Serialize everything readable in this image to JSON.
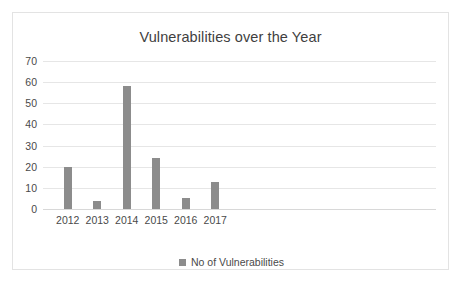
{
  "chart_data": {
    "type": "bar",
    "title": "Vulnerabilities over the Year",
    "xlabel": "",
    "ylabel": "",
    "categories": [
      "2012",
      "2013",
      "2014",
      "2015",
      "2016",
      "2017"
    ],
    "values": [
      20,
      4,
      58,
      24,
      5,
      13
    ],
    "series": [
      {
        "name": "No of Vulnerabilities",
        "values": [
          20,
          4,
          58,
          24,
          5,
          13
        ]
      }
    ],
    "ylim": [
      0,
      70
    ],
    "ytick_values": [
      0,
      10,
      20,
      30,
      40,
      50,
      60,
      70
    ],
    "ytick_labels": [
      "0",
      "10",
      "20",
      "30",
      "40",
      "50",
      "60",
      "70"
    ],
    "grid": true,
    "grid_axis": "y",
    "legend": {
      "position": "bottom",
      "entries": [
        {
          "label": "No of Vulnerabilities",
          "color": "#8c8c8c",
          "marker": "square"
        }
      ]
    },
    "colors": {
      "bar": "#8c8c8c",
      "gridline": "#e6e6e6",
      "axis": "#d8d8d8",
      "title_text": "#3f3f3f",
      "tick_text": "#4a4a4a",
      "plot_background": "#ffffff",
      "frame_border": "#e3e3e3"
    }
  }
}
